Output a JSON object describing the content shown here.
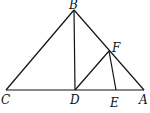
{
  "figure": {
    "type": "geometry",
    "points": {
      "A": "A",
      "B": "B",
      "C": "C",
      "D": "D",
      "E": "E",
      "F": "F"
    },
    "segments": [
      "BC",
      "BA",
      "CA",
      "BD",
      "DF",
      "FE"
    ]
  }
}
